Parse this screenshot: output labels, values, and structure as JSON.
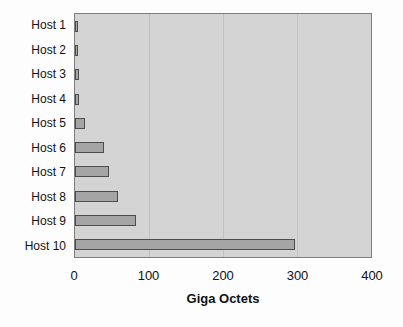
{
  "chart_data": {
    "type": "bar",
    "orientation": "horizontal",
    "categories": [
      "Host 1",
      "Host 2",
      "Host 3",
      "Host 4",
      "Host 5",
      "Host 6",
      "Host 7",
      "Host 8",
      "Host 9",
      "Host 10"
    ],
    "values": [
      4,
      4,
      5,
      5,
      14,
      39,
      46,
      58,
      83,
      297
    ],
    "title": "",
    "xlabel": "Giga Octets",
    "ylabel": "",
    "xlim": [
      0,
      400
    ],
    "x_ticks": [
      0,
      100,
      200,
      300,
      400
    ],
    "gridlines": [
      100,
      200,
      300
    ],
    "grid": true,
    "legend": "none",
    "colors": {
      "page_background": "#fdfdfd",
      "plot_background": "#d4d4d4",
      "plot_border": "#7e7e7e",
      "gridline": "#c2c2c2",
      "bar_fill": "#a5a5a5",
      "bar_border": "#4c4c4c",
      "text": "#111111"
    }
  }
}
